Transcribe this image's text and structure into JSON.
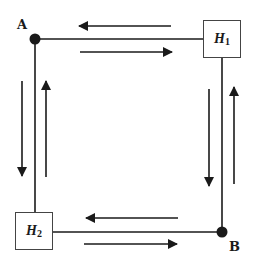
{
  "diagram": {
    "nodes": {
      "A": {
        "label": "A"
      },
      "B": {
        "label": "B"
      },
      "H1": {
        "label": "H",
        "subscript": "1"
      },
      "H2": {
        "label": "H",
        "subscript": "2"
      }
    },
    "edges": [
      {
        "from": "A",
        "to": "H1",
        "side": "top",
        "arrows": [
          "leftward (upper)",
          "rightward (lower)"
        ]
      },
      {
        "from": "H1",
        "to": "B",
        "side": "right",
        "arrows": [
          "downward (left)",
          "upward (right)"
        ]
      },
      {
        "from": "A",
        "to": "H2",
        "side": "left",
        "arrows": [
          "downward (left)",
          "upward (right)"
        ]
      },
      {
        "from": "H2",
        "to": "B",
        "side": "bottom",
        "arrows": [
          "leftward (upper)",
          "rightward (lower)"
        ]
      }
    ],
    "colors": {
      "line": "#1a1a1a",
      "box_border": "#444444",
      "background": "#ffffff"
    }
  }
}
